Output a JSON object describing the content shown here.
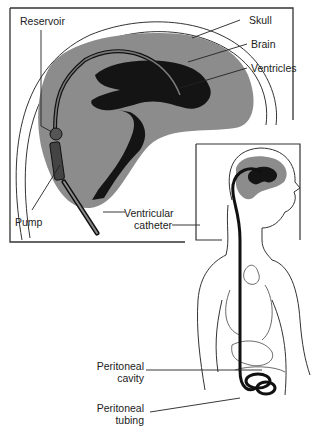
{
  "figure": {
    "colors": {
      "brain": "#8a8a8a",
      "ventricles": "#141414",
      "lines": "#222222",
      "background": "#ffffff"
    }
  },
  "labels": {
    "reservoir": "Reservoir",
    "skull": "Skull",
    "brain": "Brain",
    "ventricles": "Ventricles",
    "pump": "Pump",
    "ventricular_catheter_line1": "Ventricular",
    "ventricular_catheter_line2": "catheter",
    "peritoneal_cavity_line1": "Peritoneal",
    "peritoneal_cavity_line2": "cavity",
    "peritoneal_tubing_line1": "Peritoneal",
    "peritoneal_tubing_line2": "tubing"
  }
}
